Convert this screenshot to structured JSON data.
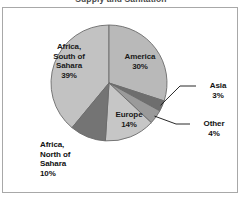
{
  "chart_data": {
    "type": "pie",
    "title": "Supply and Sanitation",
    "title_clipped": true,
    "categories": [
      "America",
      "Asia",
      "Other",
      "Europe",
      "Africa, North of Sahara",
      "Africa, South of Sahara"
    ],
    "values": [
      30,
      3,
      4,
      14,
      10,
      39
    ],
    "value_suffix": "%",
    "labels": [
      {
        "name": "America",
        "value": "30%",
        "text": "America\n30%",
        "placement": "inside"
      },
      {
        "name": "Asia",
        "value": "3%",
        "text": "Asia\n3%",
        "placement": "outside",
        "leader_line": true
      },
      {
        "name": "Other",
        "value": "4%",
        "text": "Other\n4%",
        "placement": "outside",
        "leader_line": true
      },
      {
        "name": "Europe",
        "value": "14%",
        "text": "Europe\n14%",
        "placement": "inside"
      },
      {
        "name": "Africa, North of Sahara",
        "value": "10%",
        "text": "Africa,\nNorth of\nSahara\n10%",
        "placement": "outside"
      },
      {
        "name": "Africa, South of Sahara",
        "value": "39%",
        "text": "Africa,\nSouth of\nSahara\n39%",
        "placement": "inside"
      }
    ],
    "colors": [
      "#b9b9b9",
      "#6e6e6e",
      "#9a9a9a",
      "#c6c6c6",
      "#747474",
      "#c2c2c2"
    ],
    "slice_border_color": "#6b6b6b",
    "legend": "none",
    "grid": false,
    "start_angle_deg": 0,
    "direction": "clockwise",
    "geometry": {
      "cx": 109,
      "cy": 83,
      "r": 58
    },
    "frame_color": "#a8a8a8",
    "background": "#ffffff"
  }
}
